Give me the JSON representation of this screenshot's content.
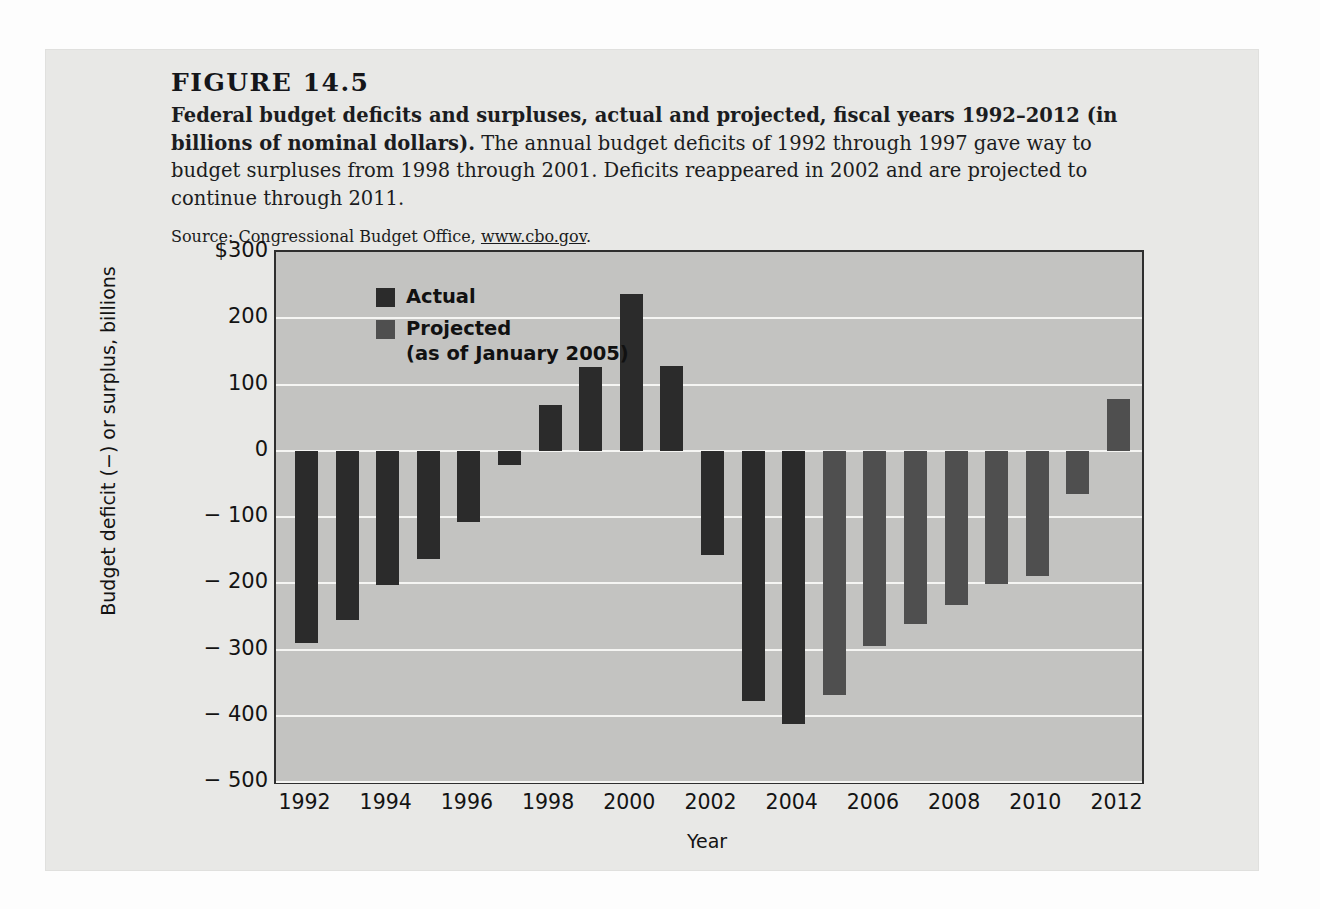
{
  "figure": {
    "number": "FIGURE 14.5",
    "title_bold": "Federal budget deficits and surpluses, actual and projected, fiscal years 1992–2012 (in billions of nominal dollars).",
    "description": " The annual budget deficits of 1992 through 1997 gave way to budget surpluses from 1998 through 2001. Deficits reappeared in 2002 and are projected to continue through 2011.",
    "source_prefix": "Source: Congressional Budget Office, ",
    "source_url": "www.cbo.gov",
    "source_suffix": "."
  },
  "legend": {
    "actual_label": "Actual",
    "projected_label": "Projected\n(as of January 2005)",
    "actual_color": "#2b2b2b",
    "projected_color": "#4f4f4f"
  },
  "chart_data": {
    "type": "bar",
    "title": "Federal budget deficits and surpluses, actual and projected, fiscal years 1992–2012",
    "xlabel": "Year",
    "ylabel": "Budget deficit (−) or surplus, billions",
    "ylim": [
      -500,
      300
    ],
    "yticks": [
      300,
      200,
      100,
      0,
      -100,
      -200,
      -300,
      -400,
      -500
    ],
    "ytick_labels": [
      "$300",
      "200",
      "100",
      "0",
      "− 100",
      "− 200",
      "− 300",
      "− 400",
      "− 500"
    ],
    "grid": true,
    "legend_position": "top-left-inside",
    "categories": [
      1992,
      1993,
      1994,
      1995,
      1996,
      1997,
      1998,
      1999,
      2000,
      2001,
      2002,
      2003,
      2004,
      2005,
      2006,
      2007,
      2008,
      2009,
      2010,
      2011,
      2012
    ],
    "xtick_labels": [
      "1992",
      "1994",
      "1996",
      "1998",
      "2000",
      "2002",
      "2004",
      "2006",
      "2008",
      "2010",
      "2012"
    ],
    "values": [
      -290,
      -255,
      -203,
      -164,
      -107,
      -22,
      69,
      126,
      236,
      128,
      -158,
      -378,
      -412,
      -368,
      -295,
      -261,
      -233,
      -201,
      -189,
      -65,
      78
    ],
    "series_of": [
      "Actual",
      "Actual",
      "Actual",
      "Actual",
      "Actual",
      "Actual",
      "Actual",
      "Actual",
      "Actual",
      "Actual",
      "Actual",
      "Actual",
      "Actual",
      "Projected",
      "Projected",
      "Projected",
      "Projected",
      "Projected",
      "Projected",
      "Projected",
      "Projected"
    ],
    "bars": [
      {
        "year": 1992,
        "value": -290,
        "kind": "actual"
      },
      {
        "year": 1993,
        "value": -255,
        "kind": "actual"
      },
      {
        "year": 1994,
        "value": -203,
        "kind": "actual"
      },
      {
        "year": 1995,
        "value": -164,
        "kind": "actual"
      },
      {
        "year": 1996,
        "value": -107,
        "kind": "actual"
      },
      {
        "year": 1997,
        "value": -22,
        "kind": "actual"
      },
      {
        "year": 1998,
        "value": 69,
        "kind": "actual"
      },
      {
        "year": 1999,
        "value": 126,
        "kind": "actual"
      },
      {
        "year": 2000,
        "value": 236,
        "kind": "actual"
      },
      {
        "year": 2001,
        "value": 128,
        "kind": "actual"
      },
      {
        "year": 2002,
        "value": -158,
        "kind": "actual"
      },
      {
        "year": 2003,
        "value": -378,
        "kind": "actual"
      },
      {
        "year": 2004,
        "value": -412,
        "kind": "actual"
      },
      {
        "year": 2005,
        "value": -368,
        "kind": "projected"
      },
      {
        "year": 2006,
        "value": -295,
        "kind": "projected"
      },
      {
        "year": 2007,
        "value": -261,
        "kind": "projected"
      },
      {
        "year": 2008,
        "value": -233,
        "kind": "projected"
      },
      {
        "year": 2009,
        "value": -201,
        "kind": "projected"
      },
      {
        "year": 2010,
        "value": -189,
        "kind": "projected"
      },
      {
        "year": 2011,
        "value": -65,
        "kind": "projected"
      },
      {
        "year": 2012,
        "value": 78,
        "kind": "projected"
      }
    ]
  }
}
